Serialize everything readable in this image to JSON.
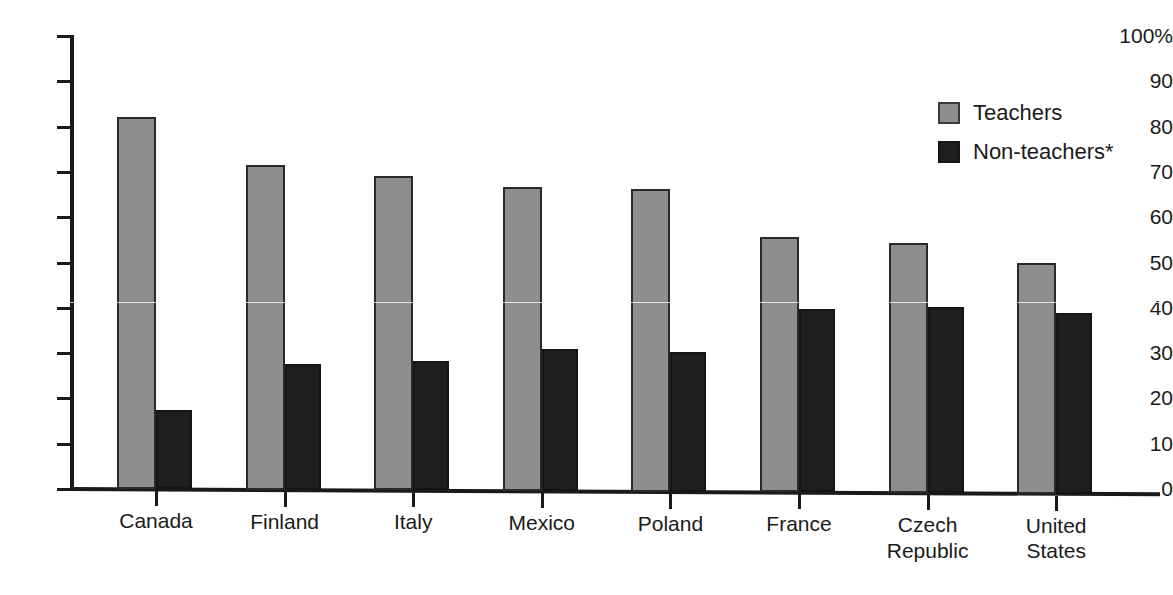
{
  "title_remnant": "",
  "legend": {
    "position": "top-right",
    "entries": [
      {
        "label": "Teachers",
        "color": "#8e8e8e",
        "swatch": "teachers"
      },
      {
        "label": "Non-teachers*",
        "color": "#1e1e1e",
        "swatch": "nonteachers"
      }
    ]
  },
  "axis": {
    "y_tick_labels": [
      "100%",
      "90",
      "80",
      "70",
      "60",
      "50",
      "40",
      "30",
      "20",
      "10",
      "0"
    ],
    "y_tick_values": [
      100,
      90,
      80,
      70,
      60,
      50,
      40,
      30,
      20,
      10,
      0
    ]
  },
  "chart_data": {
    "type": "bar",
    "title": "",
    "xlabel": "",
    "ylabel": "",
    "ylim": [
      0,
      100
    ],
    "yunit": "%",
    "grid": false,
    "legend_position": "top-right",
    "categories": [
      "Canada",
      "Finland",
      "Italy",
      "Mexico",
      "Poland",
      "France",
      "Czech Republic",
      "United States"
    ],
    "category_lines": [
      [
        "Canada"
      ],
      [
        "Finland"
      ],
      [
        "Italy"
      ],
      [
        "Mexico"
      ],
      [
        "Poland"
      ],
      [
        "France"
      ],
      [
        "Czech",
        "Republic"
      ],
      [
        "United",
        "States"
      ]
    ],
    "series": [
      {
        "name": "Teachers",
        "color": "#8e8e8e",
        "values": [
          82.2,
          71.6,
          69.1,
          66.6,
          66.2,
          55.6,
          54.2,
          50.0
        ]
      },
      {
        "name": "Non-teachers*",
        "color": "#1e1e1e",
        "values": [
          17.5,
          27.7,
          28.2,
          30.8,
          30.3,
          39.8,
          40.2,
          38.8
        ]
      }
    ],
    "footnote_marker": "*"
  }
}
